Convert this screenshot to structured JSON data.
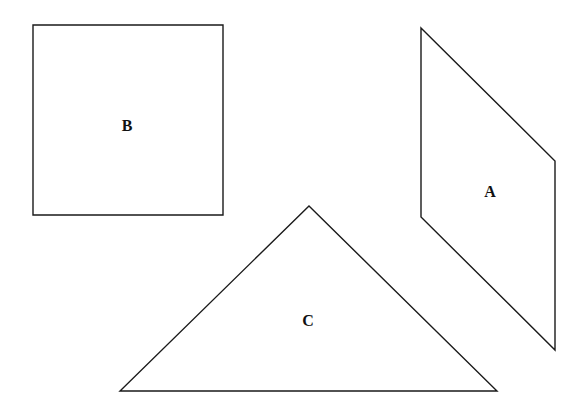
{
  "diagram": {
    "width": 588,
    "height": 413,
    "background": "#ffffff",
    "stroke_color": "#1a1a1a",
    "shapes": [
      {
        "id": "B",
        "type": "square",
        "label": "B",
        "points": "33,25 223,25 223,215 33,215",
        "label_pos": {
          "x": 127,
          "y": 131
        }
      },
      {
        "id": "A",
        "type": "parallelogram",
        "label": "A",
        "points": "421,28 555,161 555,350 421,217",
        "label_pos": {
          "x": 490,
          "y": 197
        }
      },
      {
        "id": "C",
        "type": "triangle",
        "label": "C",
        "points": "309,206 497,391 120,391",
        "label_pos": {
          "x": 308,
          "y": 326
        }
      }
    ]
  }
}
